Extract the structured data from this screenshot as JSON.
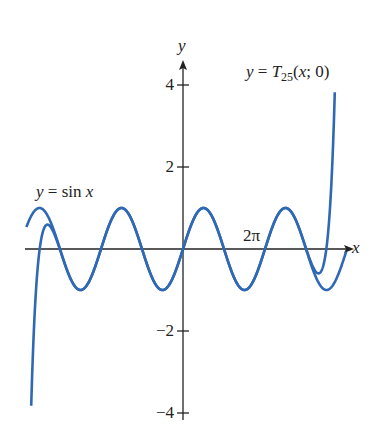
{
  "chart_data": {
    "type": "line",
    "title": "",
    "xlabel": "x",
    "ylabel": "y",
    "xlim": [
      -12.2,
      12.8
    ],
    "ylim": [
      -4.1,
      4.6
    ],
    "grid": false,
    "y_ticks": [
      {
        "value": 4,
        "label": "4"
      },
      {
        "value": 2,
        "label": "2"
      },
      {
        "value": -2,
        "label": "−2"
      },
      {
        "value": -4,
        "label": "−4"
      }
    ],
    "x_annotations": [
      {
        "value": 6.2832,
        "label": "2π"
      }
    ],
    "series": [
      {
        "name": "y = sin x",
        "function": "sin",
        "x_range": [
          -12.0,
          12.5
        ],
        "color": "#2f68b4"
      },
      {
        "name": "y = T25(x; 0)",
        "function": "taylor_sin_degree_25",
        "x_range": [
          -11.75,
          11.75
        ],
        "color": "#2f68b4"
      }
    ],
    "legend": {
      "sin_label": {
        "y": "y",
        "eq": " = sin ",
        "x": "x"
      },
      "taylor_label": {
        "y": "y",
        "eq": " = ",
        "T": "T",
        "sub": "25",
        "args": "(",
        "x": "x",
        "rest": "; 0)"
      }
    }
  },
  "axis": {
    "x_label": "x",
    "y_label": "y",
    "two_pi": "2π"
  }
}
